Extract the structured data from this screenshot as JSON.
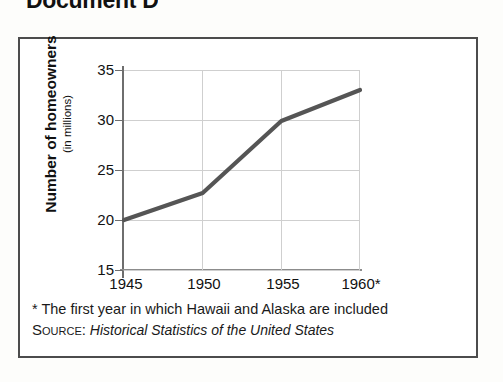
{
  "page": {
    "document_title": "Document D"
  },
  "chart_data": {
    "type": "line",
    "title": "",
    "xlabel": "",
    "ylabel": "Number of homeowners",
    "ylabel_sub": "(in millions)",
    "categories": [
      "1945",
      "1950",
      "1955",
      "1960*"
    ],
    "values": [
      20,
      22.7,
      29.9,
      33
    ],
    "series": [
      {
        "name": "Number of homeowners (in millions)",
        "values": [
          20,
          22.7,
          29.9,
          33
        ]
      }
    ],
    "ylim": [
      15,
      35
    ],
    "yticks": [
      "15",
      "20",
      "25",
      "30",
      "35"
    ],
    "ytick_values": [
      15,
      20,
      25,
      30,
      35
    ],
    "grid": true,
    "legend": "none",
    "line_color": "#555555",
    "grid_color": "#cfcfcf",
    "axis_color": "#6e6e6e"
  },
  "footnote": {
    "note": "* The first year in which Hawaii and Alaska are included",
    "source_label": "Source:",
    "source_title": "Historical Statistics of the United States"
  }
}
